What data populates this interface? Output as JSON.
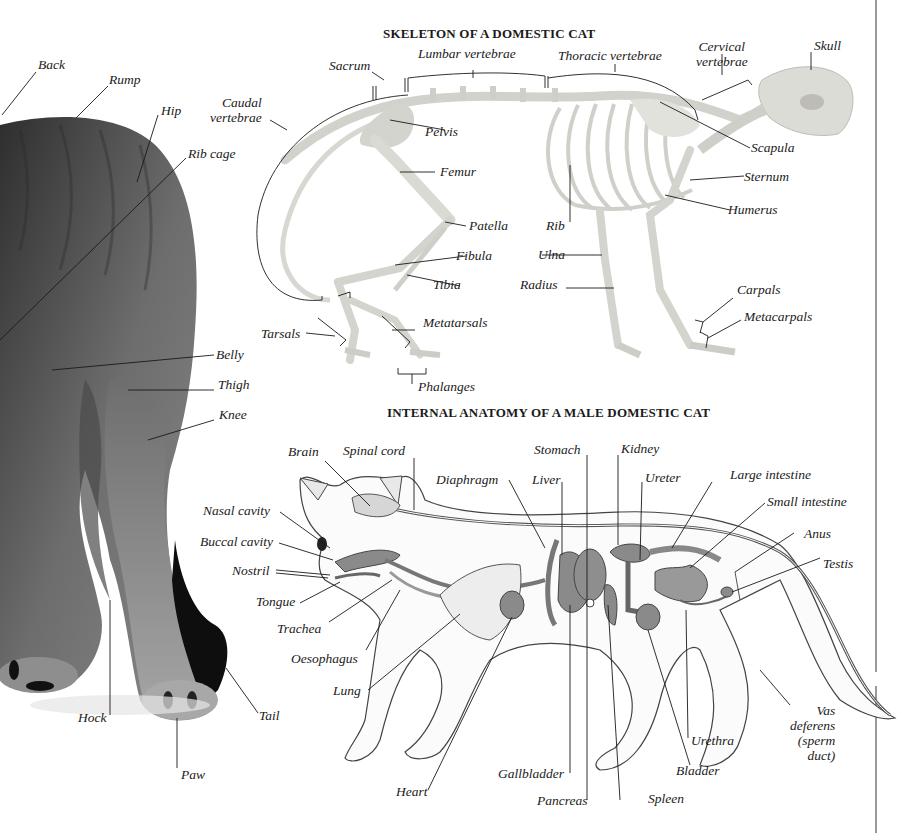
{
  "colors": {
    "background": "#ffffff",
    "ink": "#1a1a1a",
    "fur_dark": "#3c3c3c",
    "fur_mid": "#6a6a6a",
    "bone": "#e4e4e0",
    "organ": "#8a8a8a",
    "divider": "#555555"
  },
  "photo": {
    "labels": {
      "back": "Back",
      "rump": "Rump",
      "hip": "Hip",
      "rib_cage": "Rib cage",
      "belly": "Belly",
      "thigh": "Thigh",
      "knee": "Knee",
      "hock": "Hock",
      "tail": "Tail",
      "paw": "Paw"
    }
  },
  "skeleton": {
    "title": "SKELETON OF A DOMESTIC CAT",
    "labels": {
      "sacrum": "Sacrum",
      "lumbar_vertebrae": "Lumbar vertebrae",
      "thoracic_vertebrae": "Thoracic vertebrae",
      "cervical_vertebrae": "Cervical\nvertebrae",
      "skull": "Skull",
      "caudal_vertebrae": "Caudal\nvertebrae",
      "pelvis": "Pelvis",
      "scapula": "Scapula",
      "femur": "Femur",
      "sternum": "Sternum",
      "humerus": "Humerus",
      "patella": "Patella",
      "rib": "Rib",
      "fibula": "Fibula",
      "ulna": "Ulna",
      "tibia": "Tibia",
      "radius": "Radius",
      "carpals": "Carpals",
      "metacarpals": "Metacarpals",
      "tarsals": "Tarsals",
      "metatarsals": "Metatarsals",
      "phalanges": "Phalanges"
    }
  },
  "internal": {
    "title": "INTERNAL ANATOMY OF A MALE DOMESTIC CAT",
    "labels": {
      "brain": "Brain",
      "spinal_cord": "Spinal cord",
      "stomach": "Stomach",
      "kidney": "Kidney",
      "diaphragm": "Diaphragm",
      "liver": "Liver",
      "ureter": "Ureter",
      "large_intestine": "Large intestine",
      "small_intestine": "Small intestine",
      "anus": "Anus",
      "testis": "Testis",
      "nasal_cavity": "Nasal cavity",
      "buccal_cavity": "Buccal cavity",
      "nostril": "Nostril",
      "tongue": "Tongue",
      "trachea": "Trachea",
      "oesophagus": "Oesophagus",
      "lung": "Lung",
      "heart": "Heart",
      "gallbladder": "Gallbladder",
      "pancreas": "Pancreas",
      "spleen": "Spleen",
      "bladder": "Bladder",
      "urethra": "Urethra",
      "vas_deferens": "Vas\ndeferens\n(sperm\nduct)"
    }
  }
}
